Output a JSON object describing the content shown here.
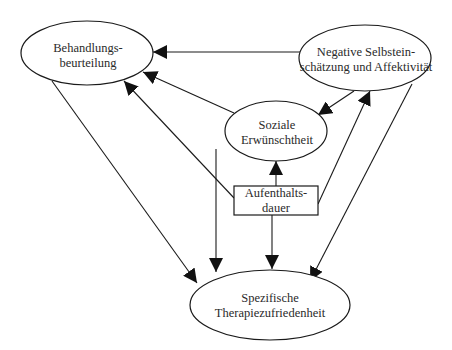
{
  "diagram": {
    "type": "path-model",
    "colors": {
      "stroke": "#1a1a1a",
      "text": "#2a2a2a",
      "background": "#ffffff"
    },
    "nodes": {
      "behandlung": {
        "line1": "Behandlungs-",
        "line2": "beurteilung",
        "shape": "ellipse"
      },
      "negative": {
        "line1": "Negative Selbstein-",
        "line2": "schätzung und Affektivität",
        "shape": "ellipse"
      },
      "soziale": {
        "line1": "Soziale",
        "line2": "Erwünschtheit",
        "shape": "ellipse"
      },
      "aufenthalt": {
        "line1": "Aufenthalts-",
        "line2": "dauer",
        "shape": "rectangle"
      },
      "spezifische": {
        "line1": "Spezifische",
        "line2": "Therapiezufriedenheit",
        "shape": "ellipse"
      }
    },
    "edges": [
      {
        "from": "Negative Selbsteinschätzung und Affektivität",
        "to": "Behandlungsbeurteilung"
      },
      {
        "from": "Negative Selbsteinschätzung und Affektivität",
        "to": "Soziale Erwünschtheit"
      },
      {
        "from": "Negative Selbsteinschätzung und Affektivität",
        "to": "Spezifische Therapiezufriedenheit"
      },
      {
        "from": "Soziale Erwünschtheit",
        "to": "Behandlungsbeurteilung"
      },
      {
        "from": "Soziale Erwünschtheit",
        "to": "Spezifische Therapiezufriedenheit"
      },
      {
        "from": "Aufenthaltsdauer",
        "to": "Soziale Erwünschtheit"
      },
      {
        "from": "Aufenthaltsdauer",
        "to": "Behandlungsbeurteilung"
      },
      {
        "from": "Aufenthaltsdauer",
        "to": "Negative Selbsteinschätzung und Affektivität"
      },
      {
        "from": "Aufenthaltsdauer",
        "to": "Spezifische Therapiezufriedenheit"
      },
      {
        "from": "Behandlungsbeurteilung",
        "to": "Spezifische Therapiezufriedenheit"
      }
    ]
  }
}
